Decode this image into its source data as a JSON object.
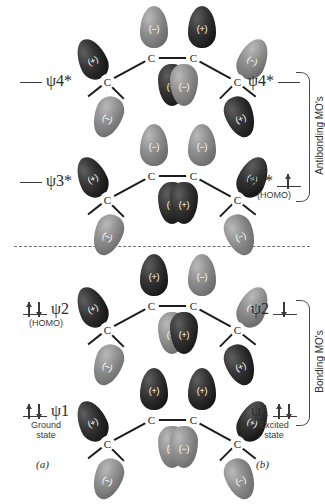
{
  "figure": {
    "divider": "dashed-separator",
    "atom_label": "C",
    "sign_positive": "(+)",
    "sign_negative": "(−)"
  },
  "groups": [
    {
      "label": "Antibonding MO's",
      "name": "antibonding"
    },
    {
      "label": "Bonding MO's",
      "name": "bonding"
    }
  ],
  "panels": [
    {
      "key": "a",
      "caption": "(a)",
      "state": "Ground state"
    },
    {
      "key": "b",
      "caption": "(b)",
      "state": "Excited state"
    }
  ],
  "levels": [
    {
      "name": "psi4-star",
      "symbol": "ψ",
      "subscript": "4",
      "star": "*",
      "left": {
        "occupancy": "empty",
        "note": ""
      },
      "right": {
        "occupancy": "empty",
        "note": ""
      },
      "lobes": {
        "c1_outer": "(+)",
        "c1_lower": "(−)",
        "c2_upper": "(−)",
        "c2_lower": "(+)",
        "c3_upper": "(+)",
        "c3_lower": "(−)",
        "c4_outer": "(−)",
        "c4_lower": "(+)"
      }
    },
    {
      "name": "psi3-star",
      "symbol": "ψ",
      "subscript": "3",
      "star": "*",
      "left": {
        "occupancy": "empty",
        "note": ""
      },
      "right": {
        "occupancy": "single-up",
        "note": "(HOMO)"
      },
      "lobes": {
        "c1_outer": "(+)",
        "c1_lower": "(−)",
        "c2_upper": "(−)",
        "c2_lower": "(+)",
        "c3_upper": "(−)",
        "c3_lower": "(+)",
        "c4_outer": "(+)",
        "c4_lower": "(−)"
      }
    },
    {
      "name": "psi2",
      "symbol": "ψ",
      "subscript": "2",
      "star": "",
      "left": {
        "occupancy": "paired",
        "note": "(HOMO)"
      },
      "right": {
        "occupancy": "single-down",
        "note": ""
      },
      "lobes": {
        "c1_outer": "(+)",
        "c1_lower": "(−)",
        "c2_upper": "(+)",
        "c2_lower": "(−)",
        "c3_upper": "(−)",
        "c3_lower": "(+)",
        "c4_outer": "(−)",
        "c4_lower": "(+)"
      }
    },
    {
      "name": "psi1",
      "symbol": "ψ",
      "subscript": "1",
      "star": "",
      "left": {
        "occupancy": "paired",
        "note": "Ground state"
      },
      "right": {
        "occupancy": "paired",
        "note": "Excited state"
      },
      "lobes": {
        "c1_outer": "(+)",
        "c1_lower": "(−)",
        "c2_upper": "(+)",
        "c2_lower": "(−)",
        "c3_upper": "(+)",
        "c3_lower": "(−)",
        "c4_outer": "(+)",
        "c4_lower": "(−)"
      }
    }
  ],
  "colors": {
    "positive_lobe": "#1a1a1a",
    "negative_lobe": "#7a7a7a",
    "text": "#2b2b2b",
    "rule": "#4a4a4a"
  }
}
